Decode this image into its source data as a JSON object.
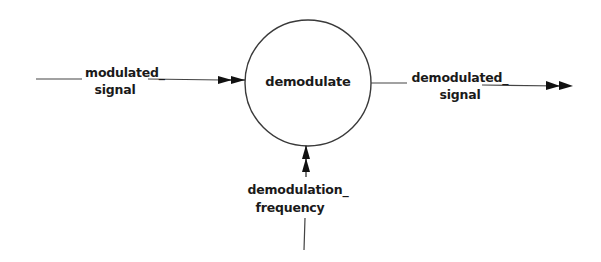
{
  "diagram": {
    "type": "data-flow",
    "process": {
      "label": "demodulate"
    },
    "flows": [
      {
        "id": "input",
        "label_line1": "modulated_",
        "label_line2": "signal",
        "direction": "into process from left"
      },
      {
        "id": "output",
        "label_line1": "demodulated_",
        "label_line2": "signal",
        "direction": "out of process to right"
      },
      {
        "id": "control",
        "label_line1": "demodulation_",
        "label_line2": "frequency",
        "direction": "into process from bottom"
      }
    ],
    "colors": {
      "stroke": "#333333",
      "text": "#1a1a1a",
      "background": "#ffffff"
    }
  }
}
